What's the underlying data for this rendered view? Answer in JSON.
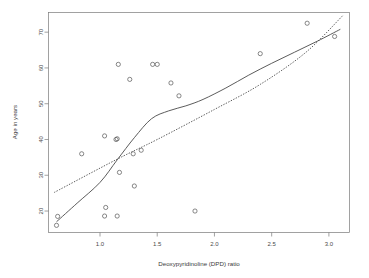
{
  "chart_data": {
    "type": "scatter",
    "title": "",
    "xlabel": "Deoxypyridinoline (DPD) ratio",
    "ylabel": "Age in years",
    "xlim": [
      0.55,
      3.18
    ],
    "ylim": [
      14.0,
      75.5
    ],
    "grid": false,
    "legend": null,
    "xticks": [
      1.0,
      1.5,
      2.0,
      2.5,
      3.0
    ],
    "xtick_labels": [
      "1.0",
      "1.5",
      "2.0",
      "2.5",
      "3.0"
    ],
    "yticks": [
      20,
      30,
      40,
      50,
      60,
      70
    ],
    "ytick_labels": [
      "20",
      "30",
      "40",
      "50",
      "60",
      "70"
    ],
    "marker": "open-circle",
    "points": [
      {
        "x": 0.63,
        "y": 18.5
      },
      {
        "x": 0.62,
        "y": 16.0
      },
      {
        "x": 0.84,
        "y": 36.0
      },
      {
        "x": 1.04,
        "y": 41.0
      },
      {
        "x": 1.05,
        "y": 21.0
      },
      {
        "x": 1.04,
        "y": 18.6
      },
      {
        "x": 1.15,
        "y": 18.6
      },
      {
        "x": 1.14,
        "y": 40.0
      },
      {
        "x": 1.15,
        "y": 40.2
      },
      {
        "x": 1.16,
        "y": 61.0
      },
      {
        "x": 1.17,
        "y": 30.8
      },
      {
        "x": 1.26,
        "y": 56.8
      },
      {
        "x": 1.29,
        "y": 36.0
      },
      {
        "x": 1.3,
        "y": 27.0
      },
      {
        "x": 1.36,
        "y": 37.0
      },
      {
        "x": 1.46,
        "y": 61.0
      },
      {
        "x": 1.5,
        "y": 61.0
      },
      {
        "x": 1.62,
        "y": 55.8
      },
      {
        "x": 1.69,
        "y": 52.2
      },
      {
        "x": 1.83,
        "y": 20.0
      },
      {
        "x": 2.4,
        "y": 64.0
      },
      {
        "x": 2.81,
        "y": 72.5
      },
      {
        "x": 3.05,
        "y": 68.8
      }
    ],
    "series": [
      {
        "name": "smoothed-fit",
        "style": "solid",
        "points": [
          {
            "x": 0.62,
            "y": 17.0
          },
          {
            "x": 0.8,
            "y": 22.2
          },
          {
            "x": 1.0,
            "y": 28.0
          },
          {
            "x": 1.15,
            "y": 34.3
          },
          {
            "x": 1.3,
            "y": 40.5
          },
          {
            "x": 1.45,
            "y": 45.8
          },
          {
            "x": 1.6,
            "y": 48.0
          },
          {
            "x": 1.75,
            "y": 49.4
          },
          {
            "x": 1.9,
            "y": 51.2
          },
          {
            "x": 2.1,
            "y": 54.4
          },
          {
            "x": 2.3,
            "y": 58.0
          },
          {
            "x": 2.5,
            "y": 61.3
          },
          {
            "x": 2.7,
            "y": 64.4
          },
          {
            "x": 2.9,
            "y": 67.5
          },
          {
            "x": 3.1,
            "y": 70.8
          }
        ]
      },
      {
        "name": "regression-fit",
        "style": "dotted",
        "points": [
          {
            "x": 0.6,
            "y": 25.2
          },
          {
            "x": 1.15,
            "y": 34.5
          },
          {
            "x": 1.5,
            "y": 40.0
          },
          {
            "x": 2.0,
            "y": 48.4
          },
          {
            "x": 2.4,
            "y": 55.4
          },
          {
            "x": 2.8,
            "y": 64.4
          },
          {
            "x": 3.12,
            "y": 74.6
          }
        ]
      }
    ]
  }
}
